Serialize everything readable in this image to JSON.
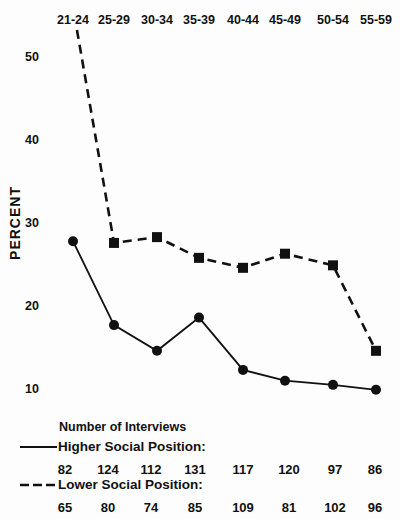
{
  "chart_data": {
    "type": "line",
    "xlabel": "AGE",
    "ylabel": "PERCENT",
    "categories": [
      "21-24",
      "25-29",
      "30-34",
      "35-39",
      "40-44",
      "45-49",
      "50-54",
      "55-59"
    ],
    "yticks": [
      10,
      20,
      30,
      40,
      50
    ],
    "ylim": [
      8,
      57
    ],
    "grid": false,
    "series": [
      {
        "name": "Higher Social Position",
        "style": "solid",
        "marker": "circle",
        "values": [
          27.8,
          17.7,
          14.6,
          18.6,
          12.3,
          11.0,
          10.5,
          9.9
        ]
      },
      {
        "name": "Lower Social Position",
        "style": "dashed",
        "marker": "square",
        "values": [
          56,
          27.6,
          28.3,
          25.8,
          24.6,
          26.3,
          24.9,
          14.6
        ],
        "note": "first point extends beyond top of plot; no marker shown"
      }
    ],
    "legend": {
      "title": "Number of Interviews",
      "placement": "bottom",
      "entries": [
        {
          "label": "Higher Social Position:",
          "style": "solid",
          "counts": [
            82,
            124,
            112,
            131,
            117,
            120,
            97,
            86
          ]
        },
        {
          "label": "Lower Social Position:",
          "style": "dashed",
          "counts": [
            65,
            80,
            74,
            85,
            109,
            81,
            102,
            96
          ]
        }
      ]
    }
  },
  "colors": {
    "ink": "#111111",
    "background": "#fdfdfd"
  }
}
